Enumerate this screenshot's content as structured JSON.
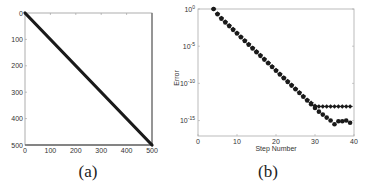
{
  "chart_data": [
    {
      "type": "line",
      "panel": "a",
      "caption": "(a)",
      "title": "",
      "xlabel": "",
      "ylabel": "",
      "xlim": [
        0,
        500
      ],
      "ylim": [
        500,
        0
      ],
      "xticks": [
        "0",
        "100",
        "200",
        "300",
        "400",
        "500"
      ],
      "yticks": [
        "0",
        "100",
        "200",
        "300",
        "400",
        "500"
      ],
      "grid": false,
      "series": [
        {
          "name": "diagonal",
          "x": [
            0,
            500
          ],
          "y": [
            0,
            500
          ],
          "color": "#1a1a1a"
        }
      ]
    },
    {
      "type": "scatter",
      "panel": "b",
      "caption": "(b)",
      "title": "",
      "xlabel": "Step Number",
      "ylabel": "Error",
      "xlim": [
        0,
        40
      ],
      "ylim_log10": [
        -17,
        0
      ],
      "xticks": [
        "0",
        "10",
        "20",
        "30",
        "40"
      ],
      "yticks": [
        "10^0",
        "10^-5",
        "10^-10",
        "10^-15"
      ],
      "yscale": "log",
      "grid": false,
      "series": [
        {
          "name": "series-plateau",
          "marker": "plus-diamond",
          "x": [
            4,
            5,
            6,
            7,
            8,
            9,
            10,
            11,
            12,
            13,
            14,
            15,
            16,
            17,
            18,
            19,
            20,
            21,
            22,
            23,
            24,
            25,
            26,
            27,
            28,
            29,
            30,
            31,
            32,
            33,
            34,
            35,
            36,
            37,
            38,
            39
          ],
          "log10_y": [
            0,
            -0.6,
            -1.2,
            -1.7,
            -2.2,
            -2.7,
            -3.2,
            -3.7,
            -4.2,
            -4.7,
            -5.2,
            -5.7,
            -6.2,
            -6.7,
            -7.2,
            -7.7,
            -8.2,
            -8.7,
            -9.2,
            -9.7,
            -10.2,
            -10.7,
            -11.2,
            -11.7,
            -12.2,
            -12.6,
            -13.0,
            -13.1,
            -13.1,
            -13.1,
            -13.1,
            -13.1,
            -13.1,
            -13.1,
            -13.1,
            -13.1
          ]
        },
        {
          "name": "series-converging",
          "marker": "circle",
          "x": [
            4,
            5,
            6,
            7,
            8,
            9,
            10,
            11,
            12,
            13,
            14,
            15,
            16,
            17,
            18,
            19,
            20,
            21,
            22,
            23,
            24,
            25,
            26,
            27,
            28,
            29,
            30,
            31,
            32,
            33,
            34,
            35,
            36,
            37,
            38,
            39
          ],
          "log10_y": [
            0,
            -0.7,
            -1.3,
            -1.8,
            -2.3,
            -2.8,
            -3.3,
            -3.8,
            -4.3,
            -4.8,
            -5.3,
            -5.8,
            -6.3,
            -6.8,
            -7.3,
            -7.8,
            -8.3,
            -8.8,
            -9.3,
            -9.8,
            -10.3,
            -10.8,
            -11.3,
            -11.8,
            -12.3,
            -12.8,
            -13.3,
            -13.8,
            -14.2,
            -14.6,
            -15.0,
            -15.5,
            -15.1,
            -15.1,
            -15.0,
            -15.3
          ]
        }
      ]
    }
  ]
}
